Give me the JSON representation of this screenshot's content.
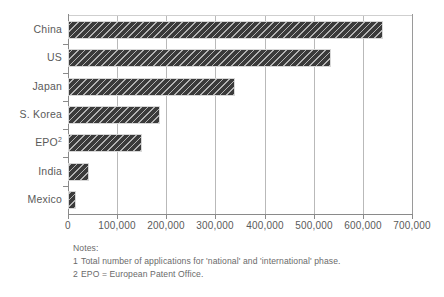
{
  "chart_data": {
    "type": "bar",
    "orientation": "horizontal",
    "title": "",
    "subtitle": "",
    "xlabel": "",
    "ylabel": "",
    "categories": [
      "China",
      "US",
      "Japan",
      "S. Korea",
      "EPO",
      "India",
      "Mexico"
    ],
    "category_labels_display": [
      "China",
      "US",
      "Japan",
      "S. Korea",
      "EPO2",
      "India",
      "Mexico"
    ],
    "values": [
      640000,
      535000,
      340000,
      188000,
      150000,
      42000,
      16000
    ],
    "series": [
      {
        "name": "Patent applications",
        "values": [
          640000,
          535000,
          340000,
          188000,
          150000,
          42000,
          16000
        ]
      }
    ],
    "xlim": [
      0,
      700000
    ],
    "xticks": [
      0,
      100000,
      200000,
      300000,
      400000,
      500000,
      600000,
      700000
    ],
    "xtick_labels": [
      "0",
      "100,000",
      "200,000",
      "300,000",
      "400,000",
      "500,000",
      "600,000",
      "700,000"
    ],
    "grid": "vertical",
    "legend": "none",
    "bar_color": "#3b3b3b",
    "bar_pattern": "diagonal-hatch",
    "gridline_color": "#b9b9b9",
    "axis_color": "#8a8a8a",
    "text_color": "#5a5a5a"
  },
  "axis": {
    "ticks": [
      {
        "label": "0",
        "value": 0
      },
      {
        "label": "100,000",
        "value": 100000
      },
      {
        "label": "200,000",
        "value": 200000
      },
      {
        "label": "300,000",
        "value": 300000
      },
      {
        "label": "400,000",
        "value": 400000
      },
      {
        "label": "500,000",
        "value": 500000
      },
      {
        "label": "600,000",
        "value": 600000
      },
      {
        "label": "700,000",
        "value": 700000
      }
    ]
  },
  "categories": [
    {
      "label": "China",
      "sup": "",
      "value": 640000
    },
    {
      "label": "US",
      "sup": "",
      "value": 535000
    },
    {
      "label": "Japan",
      "sup": "",
      "value": 340000
    },
    {
      "label": "S. Korea",
      "sup": "",
      "value": 188000
    },
    {
      "label": "EPO",
      "sup": "2",
      "value": 150000
    },
    {
      "label": "India",
      "sup": "",
      "value": 42000
    },
    {
      "label": "Mexico",
      "sup": "",
      "value": 16000
    }
  ],
  "notes": {
    "heading": "Notes:",
    "items": [
      {
        "num": "1",
        "text": "Total number of applications for 'national' and 'international' phase."
      },
      {
        "num": "2",
        "text": "EPO = European Patent Office."
      }
    ]
  }
}
